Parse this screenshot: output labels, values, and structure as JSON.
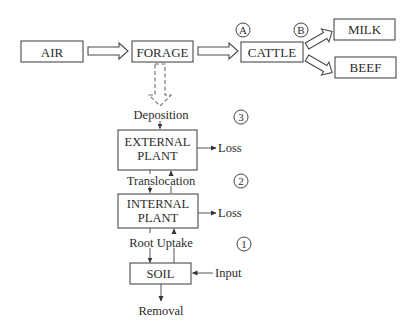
{
  "diagram": {
    "top_row": {
      "air": "AIR",
      "forage": "FORAGE",
      "cattle": "CATTLE",
      "milk": "MILK",
      "beef": "BEEF",
      "marker_a": "A",
      "marker_b": "B"
    },
    "plant_column": {
      "deposition": "Deposition",
      "external_plant_line1": "EXTERNAL",
      "external_plant_line2": "PLANT",
      "translocation": "Translocation",
      "internal_plant_line1": "INTERNAL",
      "internal_plant_line2": "PLANT",
      "root_uptake": "Root Uptake",
      "soil": "SOIL",
      "removal": "Removal",
      "loss_external": "Loss",
      "loss_internal": "Loss",
      "input": "Input",
      "marker_3": "3",
      "marker_2": "2",
      "marker_1": "1"
    }
  }
}
